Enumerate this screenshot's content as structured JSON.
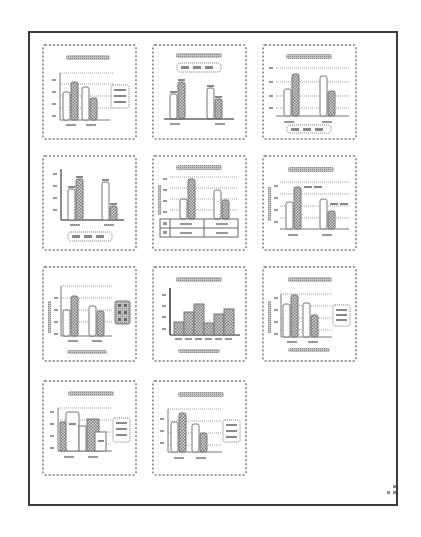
{
  "gallery": {
    "name": "Quick Layout",
    "colors": {
      "border": "#3a3a3a",
      "thumb_border": "#9a9a9a",
      "bar_dark": "#8a8a8a",
      "bar_light": "#ffffff",
      "pill": "#b0b0b0"
    },
    "layouts": [
      {
        "label": "Layout 1",
        "title": "top",
        "legend": "right",
        "gridlines": true,
        "axis_title": false,
        "data_table": false
      },
      {
        "label": "Layout 2",
        "title": "top",
        "legend": "top",
        "gridlines": false,
        "data_labels": true
      },
      {
        "label": "Layout 3",
        "title": "top",
        "legend": "bottom",
        "gridlines": true
      },
      {
        "label": "Layout 4",
        "title": "none",
        "legend": "bottom",
        "gridlines": false,
        "data_labels": true
      },
      {
        "label": "Layout 5",
        "title": "top",
        "legend": "none",
        "gridlines": true,
        "axis_title": true,
        "data_table": true
      },
      {
        "label": "Layout 6",
        "title": "top",
        "legend": "none",
        "gridlines": true,
        "axis_title": true,
        "data_labels": true
      },
      {
        "label": "Layout 7",
        "title": "none",
        "legend": "right",
        "gridlines": true,
        "axis_title": true,
        "x_axis_title": true
      },
      {
        "label": "Layout 8",
        "title": "top",
        "legend": "none",
        "gap_width": 0,
        "x_axis_title": true
      },
      {
        "label": "Layout 9",
        "title": "top",
        "legend": "right",
        "gridlines": true,
        "axis_title": true,
        "x_axis_title": true
      },
      {
        "label": "Layout 10",
        "title": "top",
        "legend": "right",
        "gridlines": true,
        "data_labels": true
      },
      {
        "label": "Layout 11",
        "title": "top",
        "legend": "right",
        "gridlines": true
      }
    ]
  }
}
